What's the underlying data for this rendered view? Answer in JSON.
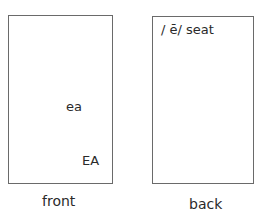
{
  "front": {
    "lowercase": "ea",
    "uppercase": "EA",
    "caption": "front"
  },
  "back": {
    "phonics": "/ ē/ seat",
    "caption": "back"
  }
}
